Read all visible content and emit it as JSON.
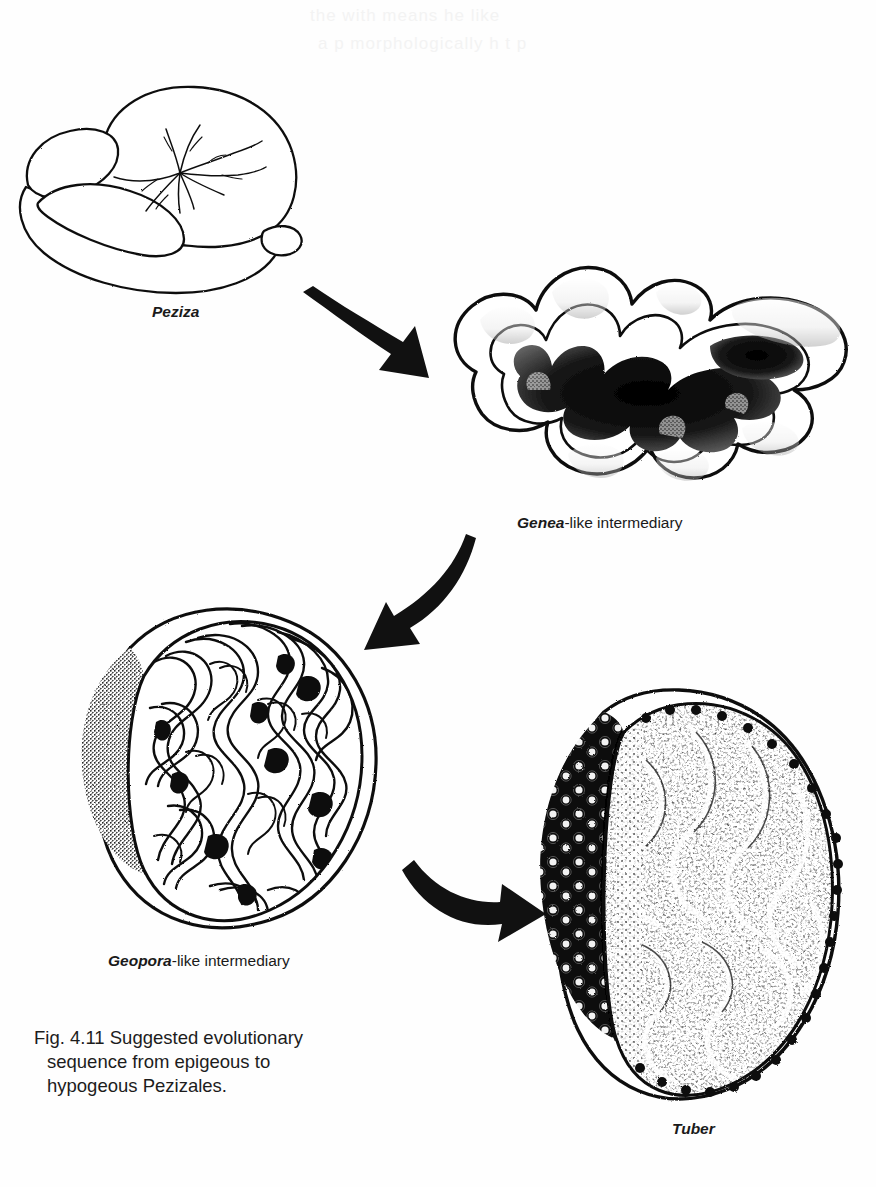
{
  "page": {
    "width": 876,
    "height": 1187,
    "background": "#ffffff",
    "ink": "#000000",
    "ghost_top_line1": "the  with  means  he  like",
    "ghost_top_line2": "a    p   morphologically    h    t   p"
  },
  "figure": {
    "number": "Fig. 4.11",
    "caption_line1": "Fig. 4.11 Suggested evolutionary",
    "caption_line2": "sequence from epigeous to",
    "caption_line3": "hypogeous Pezizales.",
    "caption_full": "Fig. 4.11 Suggested evolutionary sequence from epigeous to hypogeous Pezizales."
  },
  "specimens": [
    {
      "id": "peziza",
      "genus": "Peziza",
      "suffix": "",
      "label": "Peziza",
      "description": "epigeous convoluted apothecium with radiating veins",
      "label_x": 152,
      "label_y": 303
    },
    {
      "id": "genea",
      "genus": "Genea",
      "suffix": "-like intermediary",
      "label": "Genea-like intermediary",
      "description": "folded, infolded apothecium with dark stippled internal cavities",
      "label_x": 517,
      "label_y": 514
    },
    {
      "id": "geopora",
      "genus": "Geopora",
      "suffix": "-like intermediary",
      "label": "Geopora-like intermediary",
      "description": "sectioned hypogeous body with labyrinthine gyrose gleba and stippled rind",
      "label_x": 108,
      "label_y": 952
    },
    {
      "id": "tuber",
      "genus": "Tuber",
      "suffix": "",
      "label": "Tuber",
      "description": "hypogeous truffle, warted black peridium and marbled gleba",
      "label_x": 672,
      "label_y": 1120
    }
  ],
  "arrows": [
    {
      "id": "arrow-peziza-to-genea",
      "from": "peziza",
      "to": "genea",
      "direction": "down-right",
      "name": "curved-arrow-right-icon"
    },
    {
      "id": "arrow-genea-to-geopora",
      "from": "genea",
      "to": "geopora",
      "direction": "down-left",
      "name": "curved-arrow-left-icon"
    },
    {
      "id": "arrow-geopora-to-tuber",
      "from": "geopora",
      "to": "tuber",
      "direction": "right",
      "name": "curved-arrow-right-icon"
    }
  ]
}
